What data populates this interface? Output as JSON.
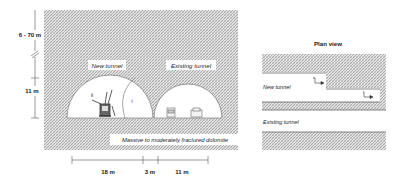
{
  "cross_section": {
    "depth_label": "6 - 70 m",
    "height_label": "11 m",
    "new_tunnel_label": "New tunnel",
    "existing_tunnel_label": "Existing tunnel",
    "section_ii_label": "ii",
    "section_i_label": "i",
    "rock_label": "Massive to moderately fractured dolomite",
    "dimensions": [
      {
        "label": "18 m"
      },
      {
        "label": "3 m"
      },
      {
        "label": "11 m"
      }
    ]
  },
  "plan_view": {
    "title": "Plan view",
    "new_tunnel_label": "New tunnel",
    "existing_tunnel_label": "Existing tunnel",
    "section_ii_label": "ii",
    "section_i_label": "i"
  },
  "colors": {
    "hatch": "#9a9a9a",
    "line": "#555555",
    "background": "#ffffff"
  }
}
